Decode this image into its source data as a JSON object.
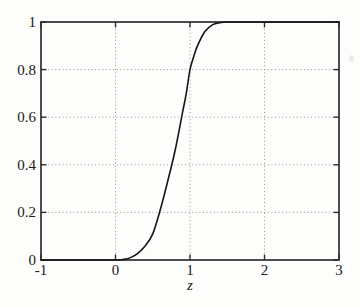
{
  "figure": {
    "background": "#fdfdfb",
    "axis_color": "#2e2e2e",
    "curve_color": "#161616",
    "grid_color": "#8c8c8c",
    "text_color": "#1b1b1b"
  },
  "chart_data": {
    "type": "line",
    "title": "",
    "xlabel": "z",
    "ylabel": "",
    "xlim": [
      -1,
      3
    ],
    "ylim": [
      0,
      1
    ],
    "xticks": [
      -1,
      0,
      1,
      2,
      3
    ],
    "xtick_labels": [
      "-1",
      "0",
      "1",
      "2",
      "3"
    ],
    "yticks": [
      0,
      0.2,
      0.4,
      0.6,
      0.8,
      1
    ],
    "ytick_labels": [
      "0",
      "0.2",
      "0.4",
      "0.6",
      "0.8",
      "1"
    ],
    "grid_x": [
      0,
      1,
      2
    ],
    "grid_y": [
      0.2,
      0.4,
      0.6,
      0.8
    ],
    "grid_style": "dotted",
    "legend_position": "none",
    "series": [
      {
        "name": "cdf-curve",
        "x": [
          -1,
          -0.5,
          0,
          0.05,
          0.1,
          0.2,
          0.3,
          0.4,
          0.5,
          0.6,
          0.7,
          0.8,
          0.9,
          0.95,
          1.0,
          1.05,
          1.1,
          1.2,
          1.3,
          1.4,
          1.5,
          2.0,
          2.5,
          3.0
        ],
        "y": [
          0,
          0,
          0,
          0.001,
          0.002,
          0.01,
          0.028,
          0.06,
          0.11,
          0.21,
          0.33,
          0.46,
          0.62,
          0.7,
          0.8,
          0.855,
          0.9,
          0.96,
          0.988,
          0.997,
          1.0,
          1.0,
          1.0,
          1.0
        ]
      }
    ]
  }
}
